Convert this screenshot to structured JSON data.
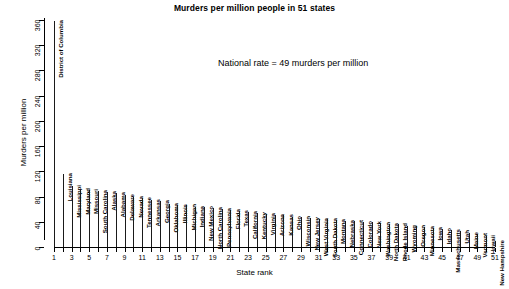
{
  "chart_data": {
    "type": "bar",
    "title": "Murders per million people in 51 states",
    "xlabel": "State rank",
    "ylabel": "Murders per million",
    "ylim": [
      0,
      360
    ],
    "yticks": [
      0,
      40,
      80,
      120,
      160,
      200,
      240,
      280,
      320,
      360
    ],
    "xlim": [
      1,
      51
    ],
    "xticks": [
      1,
      2,
      3,
      4,
      5,
      6,
      7,
      8,
      9,
      10,
      11,
      12,
      13,
      14,
      15,
      16,
      17,
      18,
      19,
      20,
      21,
      22,
      23,
      24,
      25,
      26,
      27,
      28,
      29,
      30,
      31,
      32,
      33,
      34,
      35,
      36,
      37,
      38,
      39,
      40,
      41,
      42,
      43,
      44,
      45,
      46,
      47,
      48,
      49,
      50,
      51
    ],
    "xticklabels": [
      "1",
      "",
      "3",
      "",
      "5",
      "",
      "7",
      "",
      "9",
      "",
      "11",
      "",
      "13",
      "",
      "15",
      "",
      "17",
      "",
      "19",
      "",
      "21",
      "",
      "23",
      "",
      "25",
      "",
      "27",
      "",
      "29",
      "",
      "31",
      "",
      "33",
      "",
      "35",
      "",
      "37",
      "",
      "39",
      "",
      "41",
      "",
      "43",
      "",
      "45",
      "",
      "47",
      "",
      "49",
      "",
      "51"
    ],
    "grid": false,
    "legend": null,
    "annotations": [
      {
        "text": "National rate = 49 murders per million",
        "x": 22,
        "y": 290
      }
    ],
    "categories": [
      "District of Columbia",
      "Louisiana",
      "Mississippi",
      "Maryland",
      "Missouri",
      "South Carolina",
      "Alaska",
      "Alabama",
      "Delaware",
      "Nevada",
      "Tennessee",
      "Arkansas",
      "Georgia",
      "Oklahoma",
      "Illinois",
      "Michigan",
      "Indiana",
      "New Mexico",
      "North Carolina",
      "Pennsylvania",
      "Florida",
      "Texas",
      "California",
      "Kentucky",
      "Virginia",
      "Arizona",
      "Kansas",
      "Ohio",
      "Wisconsin",
      "New Jersey",
      "West Virginia",
      "South Dakota",
      "Montana",
      "Nebraska",
      "Connecticut",
      "Colorado",
      "New York",
      "Washington",
      "North Dakota",
      "Rhode Island",
      "Wyoming",
      "Oregon",
      "Minnesota",
      "Iowa",
      "Idaho",
      "Massachusetts",
      "Utah",
      "Maine",
      "Vermont",
      "Hawaii",
      "New Hampshire"
    ],
    "ranks": [
      1,
      2,
      3,
      4,
      5,
      6,
      7,
      8,
      9,
      10,
      11,
      12,
      13,
      14,
      15,
      16,
      17,
      18,
      19,
      20,
      21,
      22,
      23,
      24,
      25,
      26,
      27,
      28,
      29,
      30,
      31,
      32,
      33,
      34,
      35,
      36,
      37,
      38,
      39,
      40,
      41,
      42,
      43,
      44,
      45,
      46,
      47,
      48,
      49,
      50,
      51
    ],
    "values": [
      358,
      115,
      97,
      92,
      90,
      89,
      87,
      86,
      82,
      79,
      77,
      74,
      73,
      68,
      67,
      66,
      64,
      63,
      62,
      60,
      58,
      57,
      56,
      54,
      52,
      51,
      50,
      48,
      47,
      46,
      45,
      44,
      43,
      42,
      41,
      40,
      39,
      38,
      37,
      36,
      34,
      33,
      32,
      30,
      29,
      27,
      25,
      22,
      20,
      17,
      9
    ],
    "national_rate": 49
  },
  "labels": {
    "title": "Murders per million people in 51 states",
    "annotation": "National rate = 49 murders per million",
    "xlabel": "State rank",
    "ylabel": "Murders per million"
  }
}
